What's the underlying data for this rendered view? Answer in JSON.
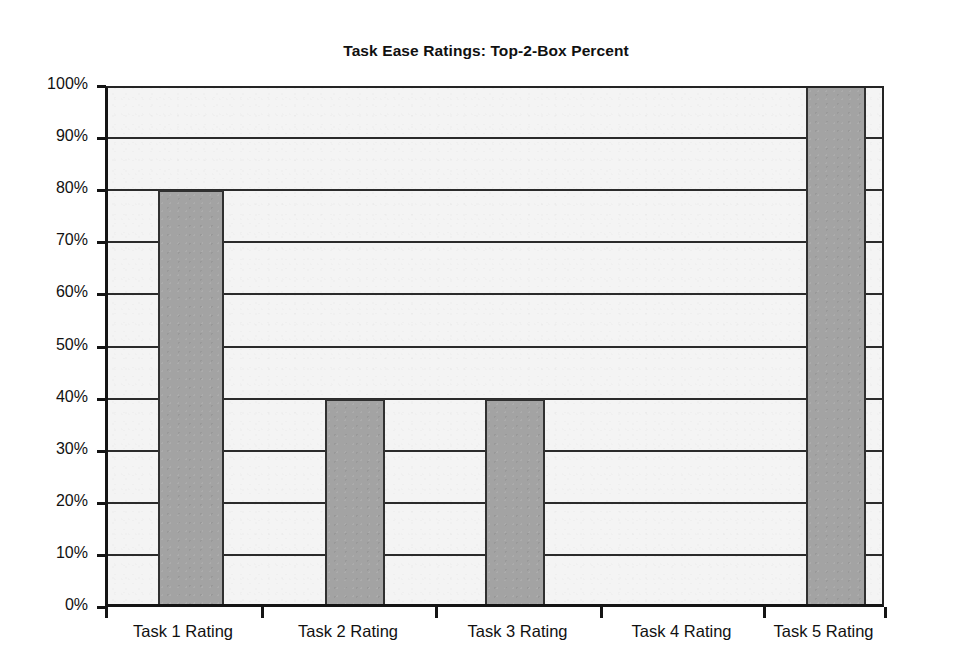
{
  "chart_data": {
    "type": "bar",
    "title": "Task Ease Ratings: Top-2-Box Percent",
    "xlabel": "",
    "ylabel": "",
    "categories": [
      "Task 1 Rating",
      "Task 2 Rating",
      "Task 3 Rating",
      "Task 4 Rating",
      "Task 5 Rating"
    ],
    "values": [
      80,
      40,
      40,
      0,
      100
    ],
    "value_unit": "%",
    "ylim": [
      0,
      100
    ],
    "ytick_step": 10,
    "ytick_labels": [
      "100%",
      "90%",
      "80%",
      "70%",
      "60%",
      "50%",
      "40%",
      "30%",
      "20%",
      "10%",
      "0%"
    ],
    "ytick_values": [
      100,
      90,
      80,
      70,
      60,
      50,
      40,
      30,
      20,
      10,
      0
    ],
    "grid": "horizontal",
    "legend": "none",
    "series": [
      {
        "name": "Top-2-Box Percent",
        "values": [
          80,
          40,
          40,
          0,
          100
        ]
      }
    ],
    "colors": {
      "bar_fill": "#a3a3a3",
      "bar_border": "#303030",
      "gridline": "#2b2b2b",
      "axis": "#141414",
      "plot_background": "#f4f4f4",
      "page_background": "#ffffff",
      "text": "#111111"
    }
  },
  "axes": {
    "y_ticks": [
      {
        "label": "100%",
        "value": 100
      },
      {
        "label": "90%",
        "value": 90
      },
      {
        "label": "80%",
        "value": 80
      },
      {
        "label": "70%",
        "value": 70
      },
      {
        "label": "60%",
        "value": 60
      },
      {
        "label": "50%",
        "value": 50
      },
      {
        "label": "40%",
        "value": 40
      },
      {
        "label": "30%",
        "value": 30
      },
      {
        "label": "20%",
        "value": 20
      },
      {
        "label": "10%",
        "value": 10
      },
      {
        "label": "0%",
        "value": 0
      }
    ],
    "x_ticks": [
      {
        "label": "Task 1 Rating"
      },
      {
        "label": "Task 2 Rating"
      },
      {
        "label": "Task 3 Rating"
      },
      {
        "label": "Task 4 Rating"
      },
      {
        "label": "Task 5 Rating"
      }
    ]
  },
  "bars": [
    {
      "category": "Task 1 Rating",
      "value": 80,
      "left": 158,
      "width": 66,
      "visible": true
    },
    {
      "category": "Task 2 Rating",
      "value": 40,
      "left": 325,
      "width": 60,
      "visible": true
    },
    {
      "category": "Task 3 Rating",
      "value": 40,
      "left": 485,
      "width": 60,
      "visible": true
    },
    {
      "category": "Task 4 Rating",
      "value": 0,
      "left": 660,
      "width": 60,
      "visible": false
    },
    {
      "category": "Task 5 Rating",
      "value": 100,
      "left": 806,
      "width": 60,
      "visible": true
    }
  ],
  "layout": {
    "plot_left": 105,
    "plot_top": 86,
    "plot_width": 779,
    "plot_height": 521,
    "x_boundaries": [
      105,
      261,
      435,
      600,
      763,
      884
    ]
  }
}
